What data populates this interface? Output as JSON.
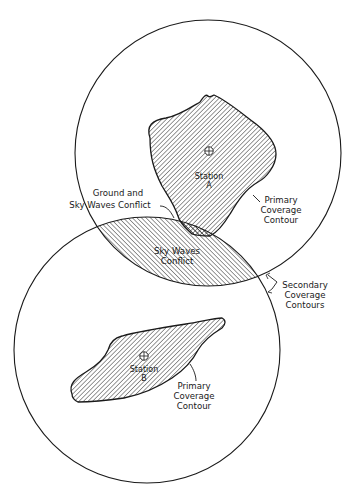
{
  "diagram": {
    "type": "radio coverage diagram",
    "colors": {
      "ink": "#1a1a1a",
      "background": "#ffffff"
    },
    "stations": [
      {
        "id": "A",
        "label_line1": "Station",
        "label_line2": "A",
        "marker": "crosshair-circle-icon"
      },
      {
        "id": "B",
        "label_line1": "Station",
        "label_line2": "B",
        "marker": "crosshair-circle-icon"
      }
    ],
    "labels": {
      "ground_sky_conflict_line1": "Ground and",
      "ground_sky_conflict_line2": "Sky Waves Conflict",
      "sky_waves_conflict_line1": "Sky Waves",
      "sky_waves_conflict_line2": "Conflict",
      "primary_a_line1": "Primary",
      "primary_a_line2": "Coverage",
      "primary_a_line3": "Contour",
      "primary_b_line1": "Primary",
      "primary_b_line2": "Coverage",
      "primary_b_line3": "Contour",
      "secondary_line1": "Secondary",
      "secondary_line2": "Coverage",
      "secondary_line3": "Contours"
    }
  }
}
